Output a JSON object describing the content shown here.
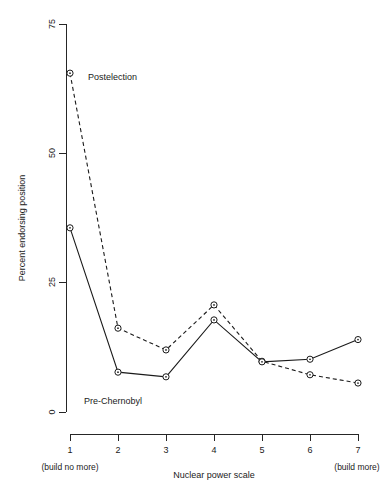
{
  "chart_data": {
    "type": "line",
    "title": "",
    "xlabel": "Nuclear power scale",
    "ylabel": "Percent endorsing position",
    "x": [
      1,
      2,
      3,
      4,
      5,
      6,
      7
    ],
    "xtick_labels": [
      "1",
      "2",
      "3",
      "4",
      "5",
      "6",
      "7"
    ],
    "ytick_labels": [
      "0",
      "25",
      "50",
      "75"
    ],
    "yticks": [
      0,
      25,
      50,
      75
    ],
    "ylim": [
      0,
      75
    ],
    "xlim": [
      1,
      7
    ],
    "grid": false,
    "legend_position": "inline-annotations",
    "x_axis_left_note": "(build no more)",
    "x_axis_right_note": "(build more)",
    "series": [
      {
        "name": "Postelection",
        "style": "dashed",
        "marker": "open-circle",
        "values": [
          65.5,
          16.2,
          12.0,
          20.7,
          9.8,
          7.2,
          5.6
        ],
        "label_x": 4,
        "label_y": 68
      },
      {
        "name": "Pre-Chernobyl",
        "style": "solid",
        "marker": "open-circle",
        "values": [
          35.6,
          7.7,
          6.8,
          17.8,
          9.7,
          10.2,
          14.0
        ],
        "label_x": 2,
        "label_y": 2
      }
    ],
    "annotations": [
      {
        "text": "Postelection",
        "x": 4,
        "y": 68
      },
      {
        "text": "Pre-Chernobyl",
        "x": 2,
        "y": 2
      }
    ]
  },
  "axis": {
    "y_title": "Percent endorsing position",
    "x_title": "Nuclear power scale",
    "y_tick_0": "0",
    "y_tick_25": "25",
    "y_tick_50": "50",
    "y_tick_75": "75",
    "x_tick_1": "1",
    "x_tick_2": "2",
    "x_tick_3": "3",
    "x_tick_4": "4",
    "x_tick_5": "5",
    "x_tick_6": "6",
    "x_tick_7": "7",
    "x_left_note": "(build no more)",
    "x_right_note": "(build more)"
  },
  "labels": {
    "postelection": "Postelection",
    "pre_chernobyl": "Pre-Chernobyl"
  },
  "colors": {
    "ink": "#1a1a1a",
    "axis": "#262626",
    "background": "#ffffff"
  }
}
